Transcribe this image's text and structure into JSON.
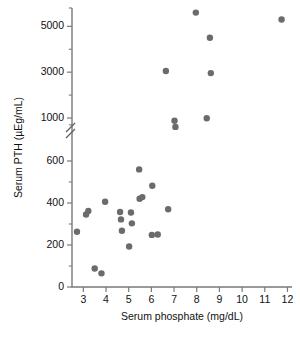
{
  "chart_data": {
    "type": "scatter",
    "title": "",
    "xlabel": "Serum phosphate (mg/dL)",
    "ylabel": "Serum PTH (µEg/mL)",
    "xlim": [
      2.5,
      12.2
    ],
    "ylim": [
      0,
      5800
    ],
    "grid": false,
    "legend": null,
    "broken_y_axis": true,
    "y_break_between": [
      600,
      1000
    ],
    "xticks": [
      3,
      4,
      5,
      6,
      7,
      8,
      9,
      10,
      11,
      12
    ],
    "xticklabels": [
      "3",
      "4",
      "5",
      "6",
      "7",
      "8",
      "9",
      "10",
      "11",
      "12"
    ],
    "yticks": [
      0,
      200,
      400,
      600,
      1000,
      3000,
      5000
    ],
    "yticklabels": [
      "0",
      "200",
      "400",
      "600",
      "1000",
      "3000",
      "5000"
    ],
    "yminorticks": [
      100,
      300,
      500,
      700,
      2000,
      4000,
      5800
    ],
    "marker": "circle",
    "marker_color": "#6b6b6b",
    "marker_size": 3.2,
    "n_points": 27,
    "points": [
      {
        "x": 2.72,
        "y": 263
      },
      {
        "x": 3.12,
        "y": 345
      },
      {
        "x": 3.22,
        "y": 362
      },
      {
        "x": 3.5,
        "y": 88
      },
      {
        "x": 3.8,
        "y": 65
      },
      {
        "x": 3.96,
        "y": 406
      },
      {
        "x": 4.62,
        "y": 357
      },
      {
        "x": 4.66,
        "y": 322
      },
      {
        "x": 4.7,
        "y": 268
      },
      {
        "x": 5.02,
        "y": 193
      },
      {
        "x": 5.1,
        "y": 355
      },
      {
        "x": 5.14,
        "y": 303
      },
      {
        "x": 5.46,
        "y": 560
      },
      {
        "x": 5.48,
        "y": 420
      },
      {
        "x": 5.6,
        "y": 428
      },
      {
        "x": 6.02,
        "y": 248
      },
      {
        "x": 6.04,
        "y": 482
      },
      {
        "x": 6.28,
        "y": 250
      },
      {
        "x": 6.64,
        "y": 3050
      },
      {
        "x": 6.74,
        "y": 370
      },
      {
        "x": 7.02,
        "y": 880
      },
      {
        "x": 7.06,
        "y": 612
      },
      {
        "x": 7.96,
        "y": 5600
      },
      {
        "x": 8.44,
        "y": 990
      },
      {
        "x": 8.58,
        "y": 4500
      },
      {
        "x": 8.62,
        "y": 2960
      },
      {
        "x": 11.74,
        "y": 5300
      }
    ]
  }
}
